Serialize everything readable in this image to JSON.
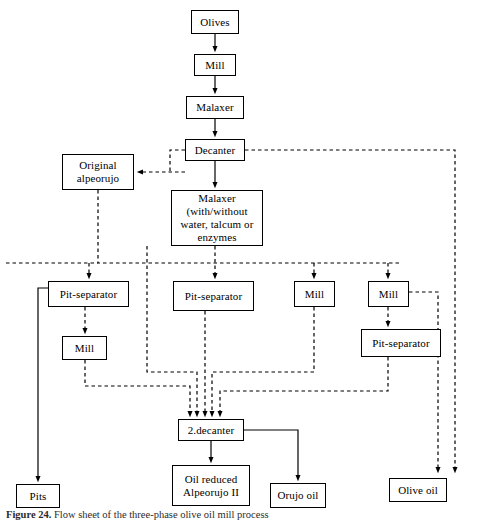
{
  "figure": {
    "caption_label": "Figure 24.",
    "caption_text": "Flow sheet of the three-phase olive oil mill process",
    "width": 478,
    "height": 525,
    "stroke_color": "#000000",
    "background_color": "#ffffff"
  },
  "nodes": {
    "olives": {
      "label": "Olives",
      "x": 191,
      "y": 10,
      "w": 48,
      "h": 24
    },
    "mill_top": {
      "label": "Mill",
      "x": 194,
      "y": 54,
      "w": 42,
      "h": 22
    },
    "malaxer_top": {
      "label": "Malaxer",
      "x": 186,
      "y": 96,
      "w": 58,
      "h": 23
    },
    "decanter": {
      "label": "Decanter",
      "x": 185,
      "y": 139,
      "w": 60,
      "h": 22
    },
    "original_alpeorujo": {
      "line1": "Original",
      "line2": "alpeorujo",
      "x": 62,
      "y": 154,
      "w": 72,
      "h": 36
    },
    "malaxer_main": {
      "line1": "Malaxer",
      "line2": "(with/without",
      "line3": "water, talcum or",
      "line4": "enzymes",
      "x": 171,
      "y": 190,
      "w": 92,
      "h": 56
    },
    "pit_separator_left": {
      "label": "Pit-separator",
      "x": 48,
      "y": 281,
      "w": 81,
      "h": 26
    },
    "pit_separator_mid": {
      "label": "Pit-separator",
      "x": 173,
      "y": 281,
      "w": 81,
      "h": 30
    },
    "mill_mid": {
      "label": "Mill",
      "x": 294,
      "y": 281,
      "w": 41,
      "h": 26
    },
    "mill_right": {
      "label": "Mill",
      "x": 368,
      "y": 281,
      "w": 41,
      "h": 26
    },
    "mill_left_lower": {
      "label": "Mill",
      "x": 62,
      "y": 336,
      "w": 45,
      "h": 24
    },
    "pit_separator_right": {
      "label": "Pit-separator",
      "x": 361,
      "y": 329,
      "w": 80,
      "h": 28
    },
    "second_decanter": {
      "label": "2.decanter",
      "x": 178,
      "y": 419,
      "w": 66,
      "h": 22
    },
    "pits": {
      "label": "Pits",
      "x": 16,
      "y": 484,
      "w": 44,
      "h": 24
    },
    "oil_reduced_alpeorujo": {
      "line1": "Oil reduced",
      "line2": "Alpeorujo II",
      "x": 172,
      "y": 465,
      "w": 78,
      "h": 41
    },
    "orujo_oil": {
      "label": "Orujo oil",
      "x": 270,
      "y": 483,
      "w": 56,
      "h": 25
    },
    "olive_oil": {
      "label": "Olive oil",
      "x": 389,
      "y": 478,
      "w": 58,
      "h": 24
    }
  },
  "edges": {
    "solid_style": "solid",
    "dashed_style": "dashed",
    "list": [
      {
        "name": "olives-to-mill",
        "style": "solid"
      },
      {
        "name": "mill-to-malaxer",
        "style": "solid"
      },
      {
        "name": "malaxer-to-decanter",
        "style": "solid"
      },
      {
        "name": "decanter-to-malaxer-main",
        "style": "solid"
      },
      {
        "name": "decanter-to-original-alpeorujo",
        "style": "dashed"
      },
      {
        "name": "decanter-to-olive-oil",
        "style": "dashed"
      },
      {
        "name": "original-alpeorujo-to-distribution-bus",
        "style": "dashed"
      },
      {
        "name": "malaxer-main-to-pit-separator-mid",
        "style": "dashed"
      },
      {
        "name": "distribution-bus-to-pit-separator-left",
        "style": "dashed"
      },
      {
        "name": "distribution-bus-to-mill-mid",
        "style": "dashed"
      },
      {
        "name": "distribution-bus-to-mill-right",
        "style": "dashed"
      },
      {
        "name": "pit-separator-left-to-pits",
        "style": "solid"
      },
      {
        "name": "pit-separator-left-to-mill-left-lower",
        "style": "dashed"
      },
      {
        "name": "mill-left-lower-to-second-decanter",
        "style": "dashed"
      },
      {
        "name": "pit-separator-mid-to-second-decanter",
        "style": "dashed"
      },
      {
        "name": "mill-mid-to-second-decanter",
        "style": "dashed"
      },
      {
        "name": "mill-right-to-pit-separator-right",
        "style": "dashed"
      },
      {
        "name": "mill-right-to-olive-oil",
        "style": "dashed"
      },
      {
        "name": "pit-separator-right-to-second-decanter",
        "style": "dashed"
      },
      {
        "name": "malaxer-bypass-to-second-decanter",
        "style": "dashed"
      },
      {
        "name": "second-decanter-to-oil-reduced-alpeorujo",
        "style": "solid"
      },
      {
        "name": "second-decanter-to-orujo-oil",
        "style": "solid"
      }
    ]
  }
}
